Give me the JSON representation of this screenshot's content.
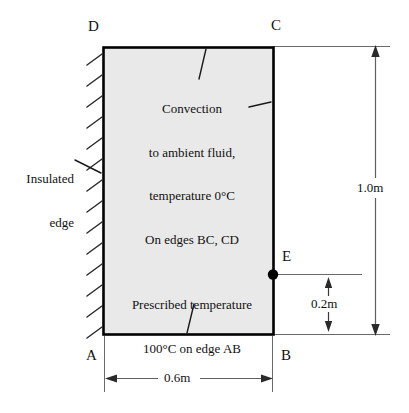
{
  "diagram": {
    "type": "heat-transfer-boundary-condition-diagram",
    "shape": "rectangle",
    "fill_color": "#e9e9e9",
    "outline_color": "#000000",
    "vertices": [
      {
        "id": "A",
        "label": "A",
        "position": "bottom-left"
      },
      {
        "id": "B",
        "label": "B",
        "position": "bottom-right"
      },
      {
        "id": "C",
        "label": "C",
        "position": "top-right"
      },
      {
        "id": "D",
        "label": "D",
        "position": "top-left"
      },
      {
        "id": "E",
        "label": "E",
        "position": "right-edge-interior"
      }
    ],
    "annotations": {
      "convection": {
        "lines": [
          "Convection",
          "to ambient fluid,",
          "temperature 0°C",
          "On edges BC, CD"
        ],
        "text": "Convection to ambient fluid, temperature 0°C On edges BC, CD",
        "applies_to_edges": "BC, CD",
        "ambient_temperature": "0°C"
      },
      "insulated": {
        "lines": [
          "Insulated",
          "edge"
        ],
        "text": "Insulated edge",
        "applies_to_edges": "AD"
      },
      "prescribed": {
        "lines": [
          "Prescribed temperature",
          "100°C on edge AB"
        ],
        "text": "Prescribed temperature 100°C on edge AB",
        "applies_to_edges": "AB",
        "temperature": "100°C"
      }
    },
    "dimensions": [
      {
        "id": "height",
        "label": "1.0m",
        "value": 1.0,
        "unit": "m",
        "orientation": "vertical",
        "spans": "A to D (full height)"
      },
      {
        "id": "offset",
        "label": "0.2m",
        "value": 0.2,
        "unit": "m",
        "orientation": "vertical",
        "spans": "B to E"
      },
      {
        "id": "width",
        "label": "0.6m",
        "value": 0.6,
        "unit": "m",
        "orientation": "horizontal",
        "spans": "A to B"
      }
    ]
  }
}
